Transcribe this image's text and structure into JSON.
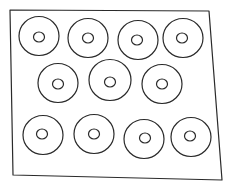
{
  "drawing": {
    "subject": "hand-drawn tray of ring-shaped donuts",
    "stroke_color": "#2a2a2a",
    "background_color": "#ffffff",
    "frame": {
      "points": [
        [
          10,
          10
        ],
        [
          209,
          11
        ],
        [
          222,
          180
        ],
        [
          13,
          175
        ]
      ]
    },
    "rows": [
      {
        "count": 4,
        "rings": [
          {
            "cx": 39,
            "cy": 36,
            "r": 20,
            "hole_cx": 39,
            "hole_cy": 37,
            "hole_r": 5
          },
          {
            "cx": 88,
            "cy": 38,
            "r": 20,
            "hole_cx": 88,
            "hole_cy": 38,
            "hole_r": 5
          },
          {
            "cx": 138,
            "cy": 40,
            "r": 20,
            "hole_cx": 137,
            "hole_cy": 40,
            "hole_r": 5
          },
          {
            "cx": 183,
            "cy": 38,
            "r": 20,
            "hole_cx": 182,
            "hole_cy": 38,
            "hole_r": 5
          }
        ]
      },
      {
        "count": 3,
        "rings": [
          {
            "cx": 58,
            "cy": 83,
            "r": 20,
            "hole_cx": 58,
            "hole_cy": 84,
            "hole_r": 5
          },
          {
            "cx": 110,
            "cy": 80,
            "r": 21,
            "hole_cx": 110,
            "hole_cy": 82,
            "hole_r": 5
          },
          {
            "cx": 162,
            "cy": 84,
            "r": 20,
            "hole_cx": 162,
            "hole_cy": 84,
            "hole_r": 5
          }
        ]
      },
      {
        "count": 4,
        "rings": [
          {
            "cx": 43,
            "cy": 135,
            "r": 20,
            "hole_cx": 42,
            "hole_cy": 134,
            "hole_r": 5
          },
          {
            "cx": 94,
            "cy": 134,
            "r": 20,
            "hole_cx": 94,
            "hole_cy": 134,
            "hole_r": 5
          },
          {
            "cx": 144,
            "cy": 139,
            "r": 20,
            "hole_cx": 145,
            "hole_cy": 138,
            "hole_r": 5
          },
          {
            "cx": 191,
            "cy": 137,
            "r": 20,
            "hole_cx": 190,
            "hole_cy": 136,
            "hole_r": 5
          }
        ]
      }
    ],
    "total_rings": 11
  }
}
